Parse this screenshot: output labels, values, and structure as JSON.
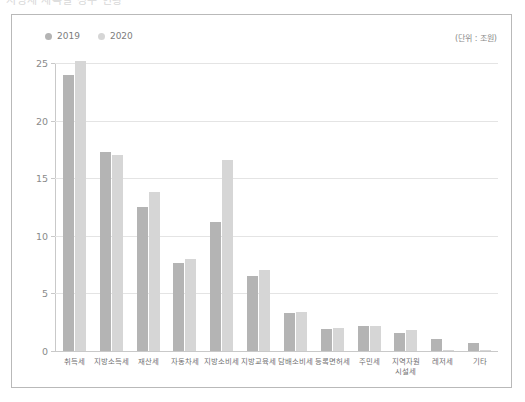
{
  "top_strip_text": "지방세 세목별 징수 현황",
  "unit_note": "(단위 : 조원)",
  "legend": [
    {
      "label": "2019",
      "color": "#b4b4b4"
    },
    {
      "label": "2020",
      "color": "#d6d6d6"
    }
  ],
  "chart_data": {
    "type": "bar",
    "title": "",
    "subtitle": "",
    "xlabel": "",
    "ylabel": "",
    "unit": "조원",
    "ylim": [
      0,
      25
    ],
    "yticks": [
      0,
      5,
      10,
      15,
      20,
      25
    ],
    "grid": true,
    "legend_position": "top-left",
    "categories": [
      "취득세",
      "지방소득세",
      "재산세",
      "자동차세",
      "지방소비세",
      "지방교육세",
      "담배소비세",
      "등록면허세",
      "주민세",
      "지역자원\n시설세",
      "레저세",
      "기타"
    ],
    "series": [
      {
        "name": "2019",
        "color": "#b4b4b4",
        "values": [
          24.0,
          17.3,
          12.5,
          7.6,
          11.2,
          6.5,
          3.3,
          1.9,
          2.2,
          1.6,
          1.0,
          0.7
        ]
      },
      {
        "name": "2020",
        "color": "#d6d6d6",
        "values": [
          25.2,
          17.0,
          13.8,
          8.0,
          16.6,
          7.0,
          3.4,
          2.0,
          2.2,
          1.8,
          0.1,
          0.1
        ]
      }
    ]
  }
}
